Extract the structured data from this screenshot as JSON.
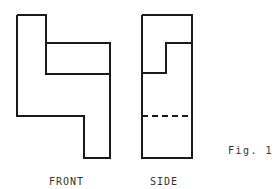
{
  "figure": {
    "caption": "Fig. 1",
    "stroke_color": "#1a1a1a",
    "stroke_width": 2
  },
  "views": [
    {
      "id": "front",
      "label": "FRONT",
      "outline": [
        [
          17,
          15
        ],
        [
          46,
          15
        ],
        [
          46,
          43
        ],
        [
          110,
          43
        ],
        [
          110,
          158
        ],
        [
          84,
          158
        ],
        [
          84,
          116
        ],
        [
          17,
          116
        ],
        [
          17,
          15
        ]
      ],
      "lines": [
        {
          "from": [
            46,
            43
          ],
          "to": [
            46,
            74
          ],
          "style": "solid"
        },
        {
          "from": [
            46,
            74
          ],
          "to": [
            110,
            74
          ],
          "style": "solid"
        }
      ]
    },
    {
      "id": "side",
      "label": "SIDE",
      "outline": [
        [
          142,
          15
        ],
        [
          192,
          15
        ],
        [
          192,
          158
        ],
        [
          142,
          158
        ],
        [
          142,
          15
        ]
      ],
      "lines": [
        {
          "from": [
            166,
            43
          ],
          "to": [
            192,
            43
          ],
          "style": "solid"
        },
        {
          "from": [
            166,
            43
          ],
          "to": [
            166,
            73
          ],
          "style": "solid"
        },
        {
          "from": [
            142,
            73
          ],
          "to": [
            166,
            73
          ],
          "style": "solid"
        },
        {
          "from": [
            142,
            116
          ],
          "to": [
            192,
            116
          ],
          "style": "dashed"
        }
      ]
    }
  ]
}
